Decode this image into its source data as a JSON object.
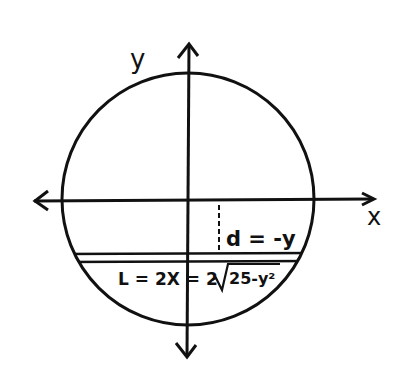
{
  "diagram": {
    "axes": {
      "x_label": "x",
      "y_label": "y"
    },
    "circle": {
      "equation_hint": "x^2 + y^2 = 25"
    },
    "annotations": {
      "depth_label": "d = -y",
      "length_label": "L = 2X = 2",
      "sqrt_content": "25-y²"
    },
    "colors": {
      "ink": "#111111",
      "background": "#ffffff"
    }
  }
}
